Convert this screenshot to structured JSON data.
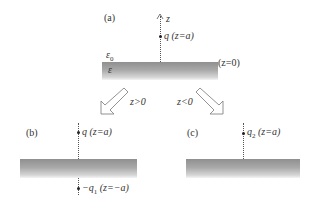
{
  "panel_a": {
    "label": "(a)",
    "axis_label": "z",
    "charge_label": "q (z=a)",
    "epsilon0_label": "ε",
    "epsilon0_sub": "0",
    "epsilon_label": "ε",
    "interface_label": "(z=0)"
  },
  "arrows": {
    "left_label": "z>0",
    "right_label": "z<0"
  },
  "panel_b": {
    "label": "(b)",
    "charge_label": "q (z=a)",
    "image_charge_prefix": "−q",
    "image_charge_sub": "1",
    "image_charge_suffix": " (z=−a)"
  },
  "panel_c": {
    "label": "(c)",
    "charge_prefix": "q",
    "charge_sub": "2",
    "charge_suffix": " (z=a)"
  },
  "colors": {
    "slab_dark": "#8f8f8f",
    "slab_light": "#f4f4f4",
    "line": "#555555"
  }
}
